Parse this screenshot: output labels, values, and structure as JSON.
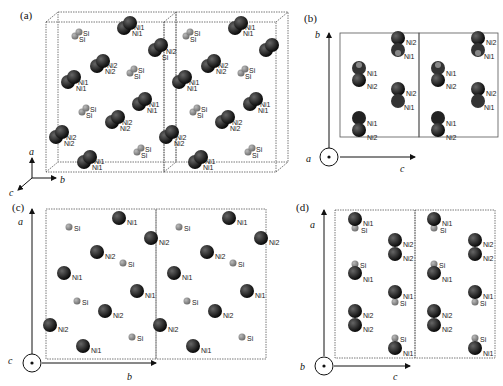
{
  "figure": {
    "panels": [
      {
        "id": "a",
        "label": "(a)",
        "view": "perspective",
        "axes": [
          "a",
          "b",
          "c"
        ]
      },
      {
        "id": "b",
        "label": "(b)",
        "view": "along a",
        "axes": {
          "vertical": "b",
          "horizontal": "c",
          "out_of_plane": "a"
        }
      },
      {
        "id": "c",
        "label": "(c)",
        "view": "along c",
        "axes": {
          "vertical": "a",
          "horizontal": "b",
          "out_of_plane": "c"
        }
      },
      {
        "id": "d",
        "label": "(d)",
        "view": "along b",
        "axes": {
          "vertical": "a",
          "horizontal": "c",
          "out_of_plane": "b"
        }
      }
    ],
    "atom_labels": {
      "ni1": "Ni1",
      "ni2": "Ni2",
      "si": "Si"
    },
    "colors": {
      "ni": "#111111",
      "si": "#8a8a8a",
      "cell": "#555555"
    }
  },
  "axis": {
    "a": "a",
    "b": "b",
    "c": "c"
  }
}
